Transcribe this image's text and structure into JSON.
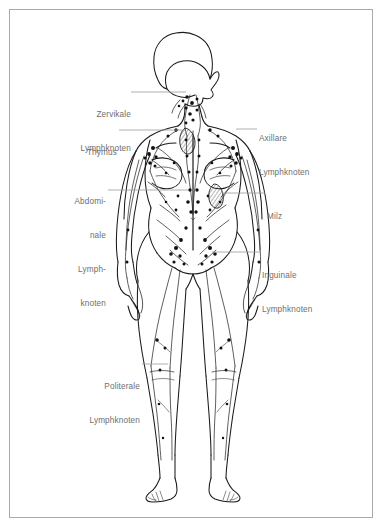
{
  "figure": {
    "style": "black-and-white-line-drawing",
    "frame_color": "#aaaaa8",
    "background_color": "#ffffff",
    "ink_color": "#1a1a1a",
    "label_color": "#6e6e6e",
    "leader_color": "#9a9a9a"
  },
  "labels": {
    "cervical": {
      "line1": "Zervikale",
      "line2": "Lymphknoten",
      "side": "left"
    },
    "thymus": {
      "line1": "Thymus",
      "side": "left"
    },
    "abdominal": {
      "line1": "Abdomi-",
      "line2": "nale",
      "line3": "Lymph-",
      "line4": "knoten",
      "side": "left"
    },
    "popliteal": {
      "line1": "Politerale",
      "line2": "Lymphknoten",
      "side": "left"
    },
    "axillary": {
      "line1": "Axillare",
      "line2": "Lymphknoten",
      "side": "right"
    },
    "spleen": {
      "line1": "Milz",
      "side": "right"
    },
    "inguinal": {
      "line1": "Inguinale",
      "line2": "Lymphknoten",
      "side": "right"
    }
  },
  "organs": {
    "thymus_marker": "thymus-organ",
    "spleen_marker": "spleen-organ"
  }
}
